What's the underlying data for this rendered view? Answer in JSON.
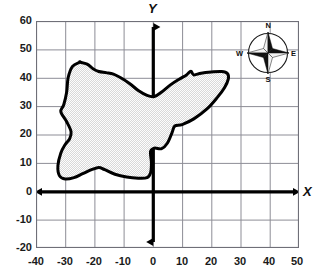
{
  "figure": {
    "axis_labels": {
      "x": "X",
      "y": "Y"
    },
    "x_ticks": [
      "-40",
      "-30",
      "-20",
      "-10",
      "0",
      "10",
      "20",
      "30",
      "40",
      "50"
    ],
    "y_ticks": [
      "60",
      "50",
      "40",
      "30",
      "20",
      "10",
      "0",
      "-10",
      "-20"
    ],
    "colors": {
      "grid": "#8d8d96",
      "border": "#6f6f78",
      "axis": "#000000",
      "outline": "#000000",
      "fill": "#ebebeb",
      "text": "#111111"
    }
  },
  "compass": {
    "name": "compass-rose",
    "north": "N",
    "east": "E",
    "south": "S",
    "west": "W"
  },
  "chart_data": {
    "type": "scatter",
    "title": "",
    "xlabel": "X",
    "ylabel": "Y",
    "xlim": [
      -40,
      50
    ],
    "ylim": [
      -20,
      60
    ],
    "xticks": [
      -40,
      -30,
      -20,
      -10,
      0,
      10,
      20,
      30,
      40,
      50
    ],
    "yticks": [
      -20,
      -10,
      0,
      10,
      20,
      30,
      40,
      50,
      60
    ],
    "grid": true,
    "legend": null,
    "series": [
      {
        "name": "region-outline",
        "closed": true,
        "filled": true,
        "points": [
          [
            -25.0,
            45.5
          ],
          [
            -27.5,
            44.0
          ],
          [
            -29.0,
            40.0
          ],
          [
            -29.5,
            35.0
          ],
          [
            -30.5,
            30.5
          ],
          [
            -31.5,
            28.0
          ],
          [
            -29.5,
            24.5
          ],
          [
            -28.0,
            21.0
          ],
          [
            -28.5,
            18.5
          ],
          [
            -30.0,
            16.5
          ],
          [
            -31.5,
            13.5
          ],
          [
            -32.5,
            9.0
          ],
          [
            -32.0,
            5.5
          ],
          [
            -30.0,
            4.3
          ],
          [
            -27.0,
            4.8
          ],
          [
            -24.0,
            6.2
          ],
          [
            -21.0,
            7.6
          ],
          [
            -18.5,
            8.4
          ],
          [
            -16.5,
            7.6
          ],
          [
            -13.0,
            6.0
          ],
          [
            -9.0,
            5.0
          ],
          [
            -5.0,
            4.6
          ],
          [
            -2.0,
            4.8
          ],
          [
            -0.8,
            6.5
          ],
          [
            -0.5,
            10.0
          ],
          [
            -0.8,
            14.0
          ],
          [
            0.5,
            15.2
          ],
          [
            3.0,
            15.0
          ],
          [
            5.0,
            17.0
          ],
          [
            6.5,
            20.5
          ],
          [
            7.5,
            23.0
          ],
          [
            10.0,
            23.5
          ],
          [
            14.0,
            25.5
          ],
          [
            18.5,
            29.0
          ],
          [
            22.0,
            33.0
          ],
          [
            24.5,
            36.5
          ],
          [
            25.8,
            39.5
          ],
          [
            25.5,
            41.5
          ],
          [
            23.5,
            42.2
          ],
          [
            20.0,
            42.0
          ],
          [
            16.5,
            41.6
          ],
          [
            14.0,
            41.0
          ],
          [
            13.0,
            42.3
          ],
          [
            11.5,
            41.0
          ],
          [
            9.0,
            39.5
          ],
          [
            6.0,
            37.5
          ],
          [
            3.0,
            35.0
          ],
          [
            0.5,
            33.4
          ],
          [
            -2.0,
            33.8
          ],
          [
            -5.0,
            35.5
          ],
          [
            -8.0,
            38.0
          ],
          [
            -11.0,
            40.0
          ],
          [
            -13.5,
            41.3
          ],
          [
            -16.0,
            41.8
          ],
          [
            -18.5,
            42.2
          ],
          [
            -20.5,
            43.2
          ],
          [
            -22.5,
            44.8
          ],
          [
            -25.0,
            45.5
          ]
        ]
      }
    ]
  }
}
